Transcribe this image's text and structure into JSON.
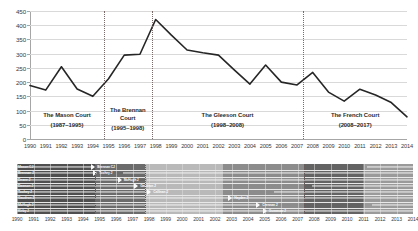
{
  "chart_data": {
    "type": "line",
    "title": "",
    "xlabel": "",
    "ylabel": "",
    "ylim": [
      0,
      450
    ],
    "yticks": [
      0,
      50,
      100,
      150,
      200,
      250,
      300,
      350,
      400,
      450
    ],
    "grid": true,
    "legend": "none",
    "x": [
      1990,
      1991,
      1992,
      1993,
      1994,
      1995,
      1996,
      1997,
      1998,
      1999,
      2000,
      2001,
      2002,
      2003,
      2004,
      2005,
      2006,
      2007,
      2008,
      2009,
      2010,
      2011,
      2012,
      2013,
      2014
    ],
    "categories": [
      "1990",
      "1991",
      "1992",
      "1993",
      "1994",
      "1995",
      "1996",
      "1997",
      "1998",
      "1999",
      "2000",
      "2001",
      "2002",
      "2003",
      "2004",
      "2005",
      "2006",
      "2007",
      "2008",
      "2009",
      "2010",
      "2011",
      "2012",
      "2013",
      "2014"
    ],
    "values": [
      188,
      172,
      254,
      176,
      150,
      212,
      295,
      298,
      420,
      365,
      313,
      303,
      295,
      243,
      193,
      260,
      200,
      190,
      234,
      165,
      133,
      175,
      155,
      128,
      78
    ],
    "series": [
      {
        "name": "Cases",
        "values": [
          188,
          172,
          254,
          176,
          150,
          212,
          295,
          298,
          420,
          365,
          313,
          303,
          295,
          243,
          193,
          260,
          200,
          190,
          234,
          165,
          133,
          175,
          155,
          128,
          78
        ],
        "color": "#262626"
      }
    ],
    "annotations": [
      {
        "id": "mason",
        "label": "The Mason Court",
        "years": "(1987–1995)",
        "start": 1990,
        "end": 1995
      },
      {
        "id": "brennan",
        "label": "The Brennan Court",
        "years": "(1995–1998)",
        "start": 1995,
        "end": 1998
      },
      {
        "id": "gleeson",
        "label": "The Gleeson Court",
        "years": "(1998–2008)",
        "start": 1998,
        "end": 2008
      },
      {
        "id": "french",
        "label": "The French Court",
        "years": "(2008–2017)",
        "start": 2008,
        "end": 2014
      }
    ],
    "dividers": [
      1994.7,
      1997.75,
      2007.4
    ]
  },
  "y_axis": {
    "ticks": [
      "450",
      "400",
      "350",
      "300",
      "250",
      "200",
      "150",
      "100",
      "50",
      "0"
    ]
  },
  "x_axis": {
    "ticks": [
      "1990",
      "1991",
      "1992",
      "1993",
      "1994",
      "1995",
      "1996",
      "1997",
      "1998",
      "1999",
      "2000",
      "2001",
      "2002",
      "2003",
      "2004",
      "2005",
      "2006",
      "2007",
      "2008",
      "2009",
      "2010",
      "2011",
      "2012",
      "2013",
      "2014"
    ]
  },
  "eras": [
    {
      "label": "The Mason Court",
      "years": "(1987–1995)"
    },
    {
      "label": "The Brennan Court",
      "years": "(1995–1998)"
    },
    {
      "label": "The Gleeson Court",
      "years": "(1998–2008)"
    },
    {
      "label": "The French Court",
      "years": "(2008–2017)"
    }
  ],
  "timeline": {
    "x_ticks": [
      "1990",
      "1991",
      "1992",
      "1993",
      "1994",
      "1995",
      "1996",
      "1997",
      "1998",
      "1999",
      "2000",
      "2001",
      "2002",
      "2003",
      "2004",
      "2005",
      "2006",
      "2007",
      "2008",
      "2009",
      "2010",
      "2011",
      "2012",
      "2013",
      "2014"
    ],
    "rows": [
      {
        "name": "Mason CJ",
        "bar_start": 1990,
        "bar_end": 1994.5,
        "end_label": "Brennan CJ",
        "second_start": 2011.2,
        "second_end": 2014,
        "second_label": "Kiefel J"
      },
      {
        "name": "Brennan J",
        "bar_start": 1990,
        "bar_end": 1994.6,
        "end_label": "Toohey J",
        "second_start": 1996.4,
        "second_end": 2014,
        "second_label": "Gummow J"
      },
      {
        "name": "Deane J",
        "bar_start": 1990,
        "bar_end": 1996.1,
        "end_label": "McHugh J",
        "second_start": 1997.9,
        "second_end": 2014,
        "second_label": "Bell J"
      },
      {
        "name": "Dawson J",
        "bar_start": 1990,
        "bar_end": 1997.1,
        "end_label": "Gaudron J",
        "second_start": 2007.9,
        "second_end": 2014,
        "second_label": ""
      },
      {
        "name": "Toohey J",
        "bar_start": 1990,
        "bar_end": 1997.9,
        "end_label": "Callinan J",
        "second_start": 2005.6,
        "second_end": 2014,
        "second_label": "Kirby J"
      },
      {
        "name": "Gaudron J",
        "bar_start": 1990,
        "bar_end": 2002.8,
        "end_label": "Hayden J",
        "second_start": 2002.8,
        "second_end": 2014,
        "second_label": ""
      },
      {
        "name": "McHugh J",
        "bar_start": 1990,
        "bar_end": 2004.5,
        "end_label": "Crennan J",
        "second_start": 2011.5,
        "second_end": 2014,
        "second_label": "Keane J"
      },
      {
        "name": "Kirby J",
        "bar_start": 1990,
        "bar_end": 2004.9,
        "end_label": "Gummow J",
        "second_start": 2004.9,
        "second_end": 2014,
        "second_label": ""
      }
    ],
    "dividers": [
      1994.7,
      1997.75,
      2007.4
    ],
    "shade_bands": [
      {
        "start": 1990,
        "end": 1994.7,
        "color": "#4f4f4f"
      },
      {
        "start": 1994.7,
        "end": 1997.75,
        "color": "#6b6b6b"
      },
      {
        "start": 1997.75,
        "end": 2002.5,
        "color": "#b9b9b9"
      },
      {
        "start": 2002.5,
        "end": 2007.4,
        "color": "#8c8c8c"
      },
      {
        "start": 2007.4,
        "end": 2011.0,
        "color": "#636363"
      },
      {
        "start": 2011.0,
        "end": 2014,
        "color": "#9a9a9a"
      }
    ]
  },
  "colors": {
    "line": "#262626",
    "grid": "#d9d9d9",
    "axis": "#a6a6a6",
    "divider": "#7b6a6a",
    "text": "#2b2b2b",
    "timeline_bg": "#8d8d8d"
  }
}
